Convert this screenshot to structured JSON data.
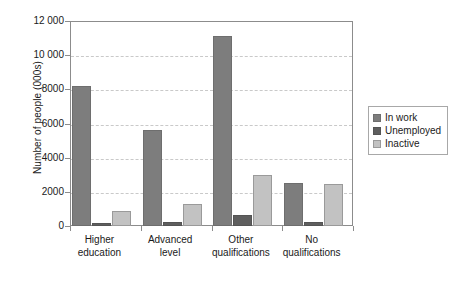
{
  "chart_data": {
    "type": "bar",
    "title": "",
    "xlabel": "",
    "ylabel": "Number of people (000s)",
    "ylim": [
      0,
      12000
    ],
    "ytick_labels": [
      "0",
      "2000",
      "4000",
      "6000",
      "8000",
      "10 000",
      "12 000"
    ],
    "ytick_values": [
      0,
      2000,
      4000,
      6000,
      8000,
      10000,
      12000
    ],
    "grid": "horizontal-dashed",
    "legend_position": "right",
    "categories": [
      "Higher education",
      "Advanced level",
      "Other qualifications",
      "No qualifications"
    ],
    "category_lines": [
      [
        "Higher",
        "education"
      ],
      [
        "Advanced",
        "level"
      ],
      [
        "Other",
        "qualifications"
      ],
      [
        "No",
        "qualifications"
      ]
    ],
    "series": [
      {
        "name": "In work",
        "color": "#7d7d7d",
        "values": [
          8200,
          5600,
          11150,
          2500
        ]
      },
      {
        "name": "Unemployed",
        "color": "#5e5e5e",
        "values": [
          200,
          210,
          650,
          250
        ]
      },
      {
        "name": "Inactive",
        "color": "#c2c2c2",
        "values": [
          900,
          1300,
          3000,
          2450
        ]
      }
    ]
  },
  "legend": {
    "items": [
      {
        "label": "In work"
      },
      {
        "label": "Unemployed"
      },
      {
        "label": "Inactive"
      }
    ]
  },
  "footer": {
    "caption": ""
  }
}
